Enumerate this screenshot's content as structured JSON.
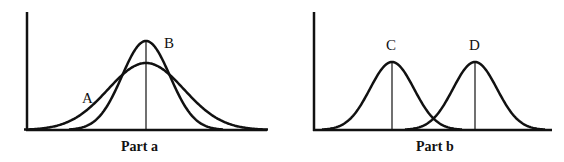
{
  "panels": [
    {
      "caption": "Part a",
      "curves": [
        {
          "label": "A",
          "center": 146,
          "sigma": 38,
          "peak_y": 63
        },
        {
          "label": "B",
          "center": 146,
          "sigma": 24,
          "peak_y": 41
        }
      ]
    },
    {
      "caption": "Part b",
      "curves": [
        {
          "label": "C",
          "center": 392,
          "sigma": 22,
          "peak_y": 62
        },
        {
          "label": "D",
          "center": 475,
          "sigma": 22,
          "peak_y": 62
        }
      ]
    }
  ],
  "colors": {
    "line": "#111111",
    "background": "#ffffff"
  }
}
